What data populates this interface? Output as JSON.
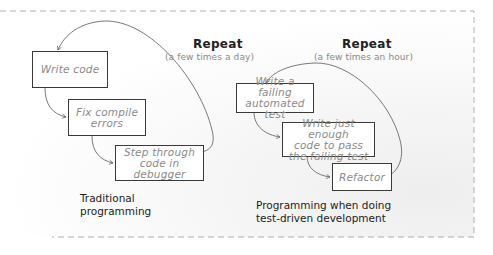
{
  "traditional": {
    "steps": [
      {
        "label": "Write code"
      },
      {
        "label": "Fix compile\nerrors"
      },
      {
        "label": "Step through\ncode in debugger"
      }
    ],
    "repeat_title": "Repeat",
    "repeat_frequency": "(a few times a day)",
    "caption": "Traditional\nprogramming"
  },
  "tdd": {
    "steps": [
      {
        "label": "Write a failing\nautomated test"
      },
      {
        "label": "Write just enough\ncode to pass\nthe failing test"
      },
      {
        "label": "Refactor"
      }
    ],
    "repeat_title": "Repeat",
    "repeat_frequency": "(a few times an hour)",
    "caption": "Programming when doing\ntest-driven development"
  },
  "colors": {
    "box_border": "#3a3a3a",
    "box_text": "#8a8a8a",
    "caption_text": "#1c1c1c",
    "arrow": "#6a6a6a",
    "frame_dash": "#b0b0b0"
  }
}
